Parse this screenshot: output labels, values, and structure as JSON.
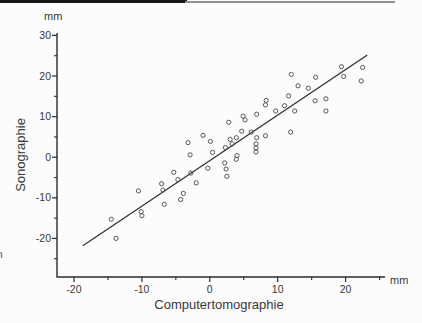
{
  "artifacts": {
    "left_edge_glyph_1": "ı",
    "left_edge_glyph_2": "n"
  },
  "chart_data": {
    "type": "scatter",
    "title": "",
    "xlabel": "Computertomographie",
    "ylabel": "Sonographie",
    "x_unit_label": "mm",
    "y_unit_label": "mm",
    "xlim": [
      -22.5,
      25.8
    ],
    "ylim": [
      -29.5,
      30.6
    ],
    "x_major_ticks": [
      -20,
      -10,
      0,
      10,
      20
    ],
    "x_minor_ticks": [
      -15,
      -5,
      5,
      15,
      25
    ],
    "y_major_ticks": [
      30,
      20,
      10,
      0,
      -10,
      -20
    ],
    "y_minor_ticks": [
      25,
      15,
      5,
      -5,
      -15,
      -25
    ],
    "grid": false,
    "legend": null,
    "axis_color": "#2b2b2b",
    "text_color": "#383838",
    "marker_style": {
      "shape": "open-circle",
      "radius": 2.1,
      "stroke": "#4f4f4f"
    },
    "fit_line": {
      "x1": -18.7,
      "y1": -21.8,
      "x2": 23.2,
      "y2": 25.2,
      "color": "#303030"
    },
    "points": [
      [
        -13.8,
        -20.0
      ],
      [
        -14.5,
        -15.3
      ],
      [
        -10.1,
        -13.4
      ],
      [
        -10.0,
        -14.4
      ],
      [
        -10.5,
        -8.3
      ],
      [
        -7.1,
        -6.5
      ],
      [
        -6.9,
        -8.1
      ],
      [
        -6.7,
        -11.6
      ],
      [
        -5.3,
        -3.7
      ],
      [
        -4.7,
        -5.5
      ],
      [
        -3.9,
        -8.9
      ],
      [
        -4.3,
        -10.4
      ],
      [
        -3.2,
        3.6
      ],
      [
        -2.9,
        0.6
      ],
      [
        -2.8,
        -3.9
      ],
      [
        -2.0,
        -6.3
      ],
      [
        -0.3,
        -2.7
      ],
      [
        -1.0,
        5.4
      ],
      [
        0.1,
        3.9
      ],
      [
        0.4,
        1.2
      ],
      [
        2.3,
        2.4
      ],
      [
        2.2,
        -1.4
      ],
      [
        2.4,
        -2.9
      ],
      [
        2.5,
        -4.7
      ],
      [
        2.8,
        8.6
      ],
      [
        3.0,
        4.4
      ],
      [
        3.9,
        4.8
      ],
      [
        3.3,
        3.3
      ],
      [
        4.0,
        0.4
      ],
      [
        3.9,
        -0.5
      ],
      [
        4.9,
        10.1
      ],
      [
        5.2,
        9.2
      ],
      [
        4.7,
        6.4
      ],
      [
        6.1,
        6.2
      ],
      [
        6.9,
        10.6
      ],
      [
        6.9,
        4.8
      ],
      [
        6.8,
        3.3
      ],
      [
        6.8,
        2.3
      ],
      [
        6.8,
        1.3
      ],
      [
        8.2,
        5.3
      ],
      [
        8.3,
        14.0
      ],
      [
        8.2,
        12.9
      ],
      [
        9.7,
        11.4
      ],
      [
        11.0,
        12.7
      ],
      [
        11.6,
        15.1
      ],
      [
        11.9,
        6.2
      ],
      [
        12.0,
        20.4
      ],
      [
        12.5,
        11.4
      ],
      [
        13.0,
        17.6
      ],
      [
        14.5,
        17.0
      ],
      [
        15.5,
        13.9
      ],
      [
        15.6,
        19.7
      ],
      [
        17.1,
        11.4
      ],
      [
        17.1,
        14.4
      ],
      [
        19.4,
        22.3
      ],
      [
        19.7,
        19.9
      ],
      [
        22.5,
        22.1
      ],
      [
        22.3,
        18.8
      ]
    ]
  }
}
